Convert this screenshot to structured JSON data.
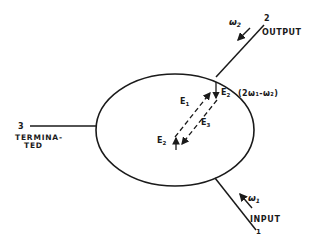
{
  "diagram": {
    "type": "three-port circulator signal diagram",
    "ports": [
      {
        "number": "1",
        "label": "INPUT",
        "frequency": "ω",
        "subscript": "1"
      },
      {
        "number": "2",
        "label": "OUTPUT",
        "frequency": "ω",
        "subscript": "2"
      },
      {
        "number": "3",
        "label_line1": "TERMINA-",
        "label_line2": "TED"
      }
    ],
    "fields": {
      "e1": {
        "base": "E",
        "sub": "1"
      },
      "e2_top": {
        "base": "E",
        "sub": "2"
      },
      "e2_bottom": {
        "base": "E",
        "sub": "2"
      },
      "e3": {
        "base": "E",
        "sub": "3"
      }
    },
    "mixing_expression": "(2ω₁-ω₂)",
    "colors": {
      "ink": "#1a1a1a",
      "background": "#ffffff"
    }
  }
}
